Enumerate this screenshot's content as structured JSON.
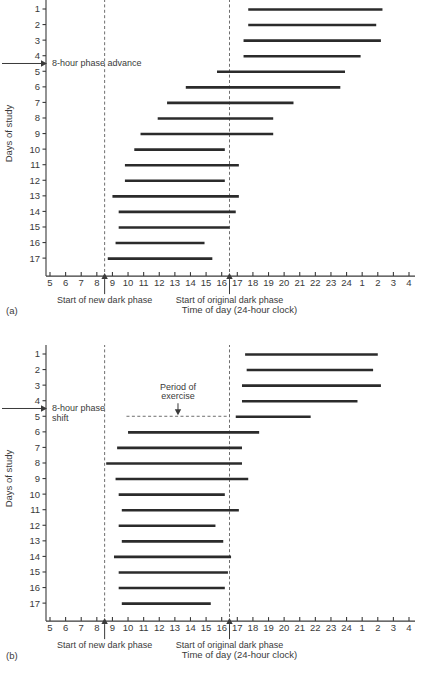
{
  "figure": {
    "panels": [
      "(a)",
      "(b)"
    ],
    "xlabel": "Time of day (24-hour clock)",
    "ylabel": "Days of study",
    "x_ticks": [
      "5",
      "6",
      "7",
      "8",
      "9",
      "10",
      "11",
      "12",
      "13",
      "14",
      "15",
      "16",
      "17",
      "18",
      "19",
      "20",
      "21",
      "22",
      "23",
      "24",
      "1",
      "2",
      "3",
      "4"
    ],
    "y_ticks": [
      "1",
      "2",
      "3",
      "4",
      "5",
      "6",
      "7",
      "8",
      "9",
      "10",
      "11",
      "12",
      "13",
      "14",
      "15",
      "16",
      "17"
    ],
    "marker_new_dark": "Start of new dark phase",
    "marker_original_dark": "Start of original dark phase",
    "bar_color": "#2b2b2b",
    "axis_color": "#3a3a3a",
    "dash_color": "#6e6e6e"
  },
  "chart_data": [
    {
      "type": "bar",
      "orientation": "horizontal-range",
      "panel": "(a)",
      "title": "8-hour phase advance",
      "xlabel": "Time of day (24-hour clock)",
      "ylabel": "Days of study",
      "xlim": [
        5,
        28
      ],
      "x_tick_hours": [
        5,
        6,
        7,
        8,
        9,
        10,
        11,
        12,
        13,
        14,
        15,
        16,
        17,
        18,
        19,
        20,
        21,
        22,
        23,
        24,
        25,
        26,
        27,
        28
      ],
      "x_tick_labels": [
        "5",
        "6",
        "7",
        "8",
        "9",
        "10",
        "11",
        "12",
        "13",
        "14",
        "15",
        "16",
        "17",
        "18",
        "19",
        "20",
        "21",
        "22",
        "23",
        "24",
        "1",
        "2",
        "3",
        "4"
      ],
      "categories": [
        "1",
        "2",
        "3",
        "4",
        "5",
        "6",
        "7",
        "8",
        "9",
        "10",
        "11",
        "12",
        "13",
        "14",
        "15",
        "16",
        "17"
      ],
      "grid": false,
      "legend": null,
      "annotations": [
        {
          "text": "8-hour phase advance",
          "at_day": 4.5,
          "arrow": "right"
        },
        {
          "text": "Start of new dark phase",
          "at_hour": 8.5,
          "arrow": "up"
        },
        {
          "text": "Start of original dark phase",
          "at_hour": 16.5,
          "arrow": "up"
        }
      ],
      "vlines": [
        {
          "hour": 8.5,
          "style": "dashed",
          "label": "Start of new dark phase"
        },
        {
          "hour": 16.5,
          "style": "dashed",
          "label": "Start of original dark phase"
        }
      ],
      "sleep_bars": [
        {
          "day": 1,
          "start_hour": 17.7,
          "end_hour": 26.3
        },
        {
          "day": 2,
          "start_hour": 17.7,
          "end_hour": 25.9
        },
        {
          "day": 3,
          "start_hour": 17.4,
          "end_hour": 26.2
        },
        {
          "day": 4,
          "start_hour": 17.4,
          "end_hour": 24.9
        },
        {
          "day": 5,
          "start_hour": 15.7,
          "end_hour": 23.9
        },
        {
          "day": 6,
          "start_hour": 13.7,
          "end_hour": 23.6
        },
        {
          "day": 7,
          "start_hour": 12.5,
          "end_hour": 20.6
        },
        {
          "day": 8,
          "start_hour": 11.9,
          "end_hour": 19.3
        },
        {
          "day": 9,
          "start_hour": 10.8,
          "end_hour": 19.3
        },
        {
          "day": 10,
          "start_hour": 10.4,
          "end_hour": 16.2
        },
        {
          "day": 11,
          "start_hour": 9.8,
          "end_hour": 17.1
        },
        {
          "day": 12,
          "start_hour": 9.8,
          "end_hour": 16.2
        },
        {
          "day": 13,
          "start_hour": 9.0,
          "end_hour": 17.1
        },
        {
          "day": 14,
          "start_hour": 9.4,
          "end_hour": 16.9
        },
        {
          "day": 15,
          "start_hour": 9.4,
          "end_hour": 16.5
        },
        {
          "day": 16,
          "start_hour": 9.2,
          "end_hour": 14.9
        },
        {
          "day": 17,
          "start_hour": 8.7,
          "end_hour": 15.4
        }
      ]
    },
    {
      "type": "bar",
      "orientation": "horizontal-range",
      "panel": "(b)",
      "title": "8-hour phase shift with period of exercise",
      "xlabel": "Time of day (24-hour clock)",
      "ylabel": "Days of study",
      "xlim": [
        5,
        28
      ],
      "x_tick_hours": [
        5,
        6,
        7,
        8,
        9,
        10,
        11,
        12,
        13,
        14,
        15,
        16,
        17,
        18,
        19,
        20,
        21,
        22,
        23,
        24,
        25,
        26,
        27,
        28
      ],
      "x_tick_labels": [
        "5",
        "6",
        "7",
        "8",
        "9",
        "10",
        "11",
        "12",
        "13",
        "14",
        "15",
        "16",
        "17",
        "18",
        "19",
        "20",
        "21",
        "22",
        "23",
        "24",
        "1",
        "2",
        "3",
        "4"
      ],
      "categories": [
        "1",
        "2",
        "3",
        "4",
        "5",
        "6",
        "7",
        "8",
        "9",
        "10",
        "11",
        "12",
        "13",
        "14",
        "15",
        "16",
        "17"
      ],
      "grid": false,
      "legend": null,
      "annotations": [
        {
          "text": "8-hour phase shift",
          "at_day": 4.5,
          "arrow": "right"
        },
        {
          "text": "Period of exercise",
          "at_hour": 13.6,
          "arrow": "down"
        },
        {
          "text": "Start of new dark phase",
          "at_hour": 8.5,
          "arrow": "up"
        },
        {
          "text": "Start of original dark phase",
          "at_hour": 16.5,
          "arrow": "up"
        }
      ],
      "vlines": [
        {
          "hour": 8.5,
          "style": "dashed",
          "label": "Start of new dark phase"
        },
        {
          "hour": 16.5,
          "style": "dashed",
          "label": "Start of original dark phase"
        }
      ],
      "exercise_span": {
        "start_hour": 9.9,
        "end_hour": 16.5,
        "at_day": 5.0,
        "style": "dashed"
      },
      "sleep_bars": [
        {
          "day": 1,
          "start_hour": 17.5,
          "end_hour": 26.0
        },
        {
          "day": 2,
          "start_hour": 17.6,
          "end_hour": 25.7
        },
        {
          "day": 3,
          "start_hour": 17.3,
          "end_hour": 26.2
        },
        {
          "day": 4,
          "start_hour": 17.3,
          "end_hour": 24.7
        },
        {
          "day": 5,
          "start_hour": 16.9,
          "end_hour": 21.7
        },
        {
          "day": 6,
          "start_hour": 10.0,
          "end_hour": 18.4
        },
        {
          "day": 7,
          "start_hour": 9.3,
          "end_hour": 17.3
        },
        {
          "day": 8,
          "start_hour": 8.6,
          "end_hour": 17.3
        },
        {
          "day": 9,
          "start_hour": 9.2,
          "end_hour": 17.7
        },
        {
          "day": 10,
          "start_hour": 9.4,
          "end_hour": 16.2
        },
        {
          "day": 11,
          "start_hour": 9.6,
          "end_hour": 17.1
        },
        {
          "day": 12,
          "start_hour": 9.4,
          "end_hour": 15.6
        },
        {
          "day": 13,
          "start_hour": 9.6,
          "end_hour": 16.1
        },
        {
          "day": 14,
          "start_hour": 9.1,
          "end_hour": 16.6
        },
        {
          "day": 15,
          "start_hour": 9.4,
          "end_hour": 16.4
        },
        {
          "day": 16,
          "start_hour": 9.4,
          "end_hour": 16.2
        },
        {
          "day": 17,
          "start_hour": 9.6,
          "end_hour": 15.3
        }
      ]
    }
  ]
}
